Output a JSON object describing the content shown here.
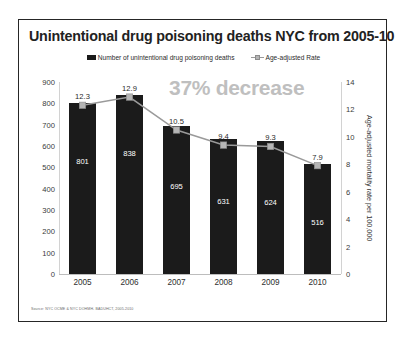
{
  "chart_data": {
    "type": "bar",
    "title": "Unintentional drug poisoning deaths NYC from 2005-10",
    "categories": [
      "2005",
      "2006",
      "2007",
      "2008",
      "2009",
      "2010"
    ],
    "xlabel": "",
    "ylabel": "",
    "ylabel_right": "Age-adjusted mortality rate per 100,000",
    "ylim": [
      0,
      900
    ],
    "ylim_right": [
      0,
      14
    ],
    "yticks": [
      "900",
      "800",
      "700",
      "600",
      "500",
      "400",
      "300",
      "200",
      "100",
      "0"
    ],
    "yticks_right": [
      "14",
      "12",
      "10",
      "8",
      "6",
      "4",
      "2",
      "0"
    ],
    "grid": false,
    "legend_position": "top-center",
    "series": [
      {
        "name": "Number of unintentional drug poisoning deaths",
        "type": "bar",
        "axis": "left",
        "color": "#1b1b1b",
        "values": [
          801,
          838,
          695,
          631,
          624,
          516
        ],
        "labels": [
          "801",
          "838",
          "695",
          "631",
          "624",
          "516"
        ]
      },
      {
        "name": "Age-adjusted Rate",
        "type": "line",
        "axis": "right",
        "color": "#9a9a9a",
        "marker_color": "#b5b5b5",
        "values": [
          12.3,
          12.9,
          10.5,
          9.4,
          9.3,
          7.9
        ],
        "labels": [
          "12.3",
          "12.9",
          "10.5",
          "9.4",
          "9.3",
          "7.9"
        ]
      }
    ],
    "annotations": [
      {
        "text": "37% decrease",
        "color": "#bfbfbf"
      }
    ],
    "source_note": "Source: NYC OCME & NYC DOHMH- BADUHCT, 2005-2010"
  }
}
